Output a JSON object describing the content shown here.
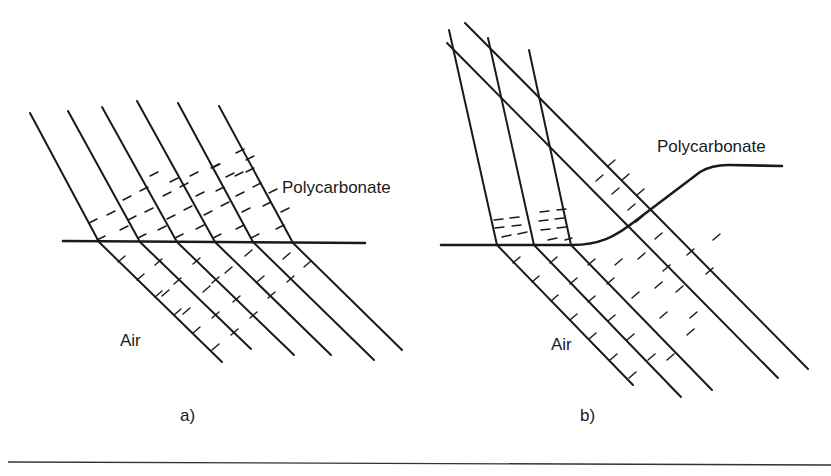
{
  "figure": {
    "panel_a": {
      "caption": "a)",
      "label_top_medium": "Polycarbonate",
      "label_bottom_medium": "Air",
      "interface": "flat",
      "ray_count": 6
    },
    "panel_b": {
      "caption": "b)",
      "label_top_medium": "Polycarbonate",
      "label_bottom_medium": "Air",
      "interface": "stepped-curved",
      "ray_count": 5
    }
  },
  "colors": {
    "ink": "#1a1a1a",
    "background": "#ffffff"
  }
}
